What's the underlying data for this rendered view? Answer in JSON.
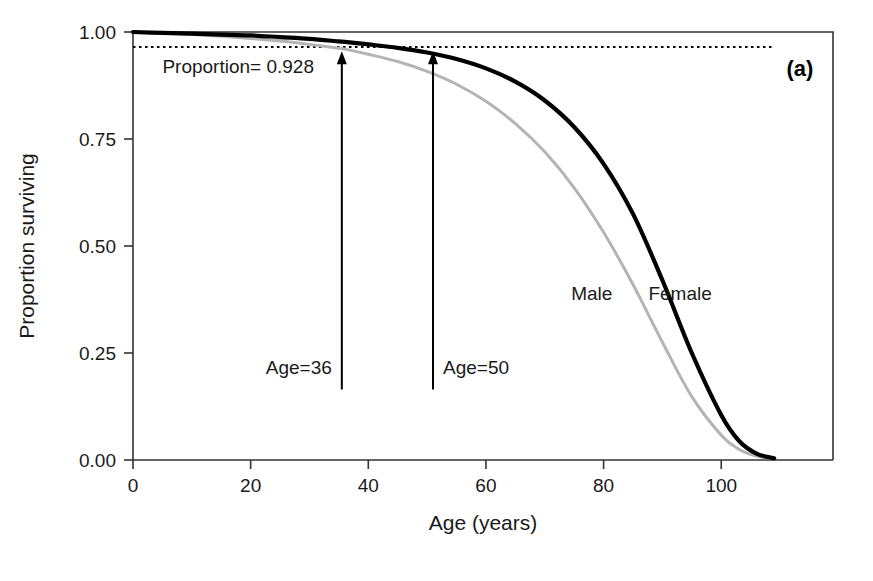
{
  "figure": {
    "panel_label": "(a)",
    "background_color": "#ffffff"
  },
  "chart_data": {
    "type": "line",
    "title": "",
    "xlabel": "Age (years)",
    "ylabel": "Proportion surviving",
    "xlim": [
      0,
      119
    ],
    "ylim": [
      0,
      1.0
    ],
    "xticks": [
      0,
      20,
      40,
      60,
      80,
      100
    ],
    "xtick_labels": [
      "0",
      "20",
      "40",
      "60",
      "80",
      "100"
    ],
    "yticks": [
      0.0,
      0.25,
      0.5,
      0.75,
      1.0
    ],
    "ytick_labels": [
      "0.00",
      "0.25",
      "0.50",
      "0.75",
      "1.00"
    ],
    "grid": false,
    "legend_position": "inline-curve-labels",
    "colors": {
      "female": "#000000",
      "male": "#b4b4b4",
      "axis": "#333333",
      "annotation": "#1a1a1a"
    },
    "series": [
      {
        "name": "Female",
        "color": "#000000",
        "label": "Female",
        "label_x": 93,
        "label_y": 0.375,
        "x": [
          0,
          5,
          10,
          15,
          20,
          25,
          30,
          35,
          36,
          40,
          45,
          50,
          55,
          60,
          65,
          70,
          75,
          80,
          85,
          90,
          95,
          100,
          103,
          106,
          109
        ],
        "values": [
          1.0,
          0.998,
          0.996,
          0.994,
          0.992,
          0.988,
          0.984,
          0.978,
          0.977,
          0.971,
          0.963,
          0.952,
          0.937,
          0.915,
          0.884,
          0.84,
          0.778,
          0.692,
          0.575,
          0.42,
          0.25,
          0.105,
          0.045,
          0.015,
          0.004
        ]
      },
      {
        "name": "Male",
        "color": "#b4b4b4",
        "label": "Male",
        "label_x": 78,
        "label_y": 0.375,
        "x": [
          0,
          5,
          10,
          15,
          20,
          25,
          30,
          35,
          36,
          40,
          45,
          50,
          55,
          60,
          65,
          70,
          75,
          80,
          85,
          90,
          95,
          100,
          103,
          106,
          109
        ],
        "values": [
          1.0,
          0.997,
          0.994,
          0.99,
          0.985,
          0.979,
          0.971,
          0.962,
          0.96,
          0.948,
          0.931,
          0.908,
          0.878,
          0.838,
          0.786,
          0.72,
          0.636,
          0.532,
          0.41,
          0.275,
          0.148,
          0.058,
          0.025,
          0.009,
          0.003
        ]
      }
    ],
    "annotations": [
      {
        "name": "proportion-reference-line",
        "type": "hline",
        "style": "dotted",
        "y": 0.965,
        "x_start": 0,
        "x_end": 109,
        "label": "Proportion= 0.928",
        "label_x": 5,
        "label_y": 0.905
      },
      {
        "name": "age-36-arrow",
        "type": "arrow",
        "x": 35.5,
        "y_start": 0.165,
        "y_end": 0.955,
        "label": "Age=36",
        "label_x": 25,
        "label_y": 0.2
      },
      {
        "name": "age-50-arrow",
        "type": "arrow",
        "x": 51,
        "y_start": 0.165,
        "y_end": 0.955,
        "label": "Age=50",
        "label_x": 53,
        "label_y": 0.2
      }
    ]
  }
}
